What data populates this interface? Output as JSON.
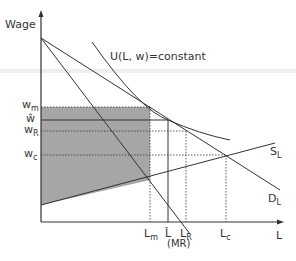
{
  "diagram": {
    "y_axis_label": "Wage",
    "x_axis_label": "L",
    "curve_labels": {
      "utility": "U(L, w)=constant",
      "supply_main": "S",
      "supply_sub": "L",
      "demand_main": "D",
      "demand_sub": "L",
      "marginal_revenue": "(MR)"
    },
    "wage_labels": {
      "wm_main": "w",
      "wm_sub": "m",
      "what": "ŵ",
      "wR_main": "w",
      "wR_sub": "R",
      "wc_main": "w",
      "wc_sub": "c"
    },
    "labor_labels": {
      "Lm_main": "L",
      "Lm_sub": "m",
      "Lhat": "L̂",
      "LR_main": "L",
      "LR_sub": "R",
      "Lc_main": "L",
      "Lc_sub": "c"
    },
    "colors": {
      "line": "#333333",
      "shade": "#a6a6a6",
      "band": "#eeeeee"
    }
  }
}
